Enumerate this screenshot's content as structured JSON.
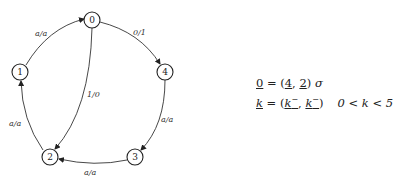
{
  "diagram": {
    "type": "state-machine",
    "nodes": [
      {
        "id": "0",
        "label": "0",
        "x": 92,
        "y": 20
      },
      {
        "id": "1",
        "label": "1",
        "x": 20,
        "y": 72
      },
      {
        "id": "2",
        "label": "2",
        "x": 50,
        "y": 157
      },
      {
        "id": "3",
        "label": "3",
        "x": 135,
        "y": 157
      },
      {
        "id": "4",
        "label": "4",
        "x": 165,
        "y": 72
      }
    ],
    "edges": [
      {
        "from": "1",
        "to": "0",
        "label": "a/a"
      },
      {
        "from": "0",
        "to": "4",
        "label": "0/1"
      },
      {
        "from": "0",
        "to": "2",
        "label": "1/0"
      },
      {
        "from": "4",
        "to": "3",
        "label": "a/a"
      },
      {
        "from": "3",
        "to": "2",
        "label": "a/a"
      },
      {
        "from": "2",
        "to": "1",
        "label": "a/a"
      }
    ]
  },
  "formulas": {
    "line1": {
      "lhs": "0",
      "eq": " = (",
      "a": "4",
      "comma": ", ",
      "b": "2",
      "close": ")",
      "sigma": " σ"
    },
    "line2": {
      "lhs": "k",
      "eq": " = (",
      "a": "k",
      "a_sup": "−",
      "comma": ", ",
      "b": "k",
      "b_sup": "−",
      "close": ")",
      "cond": "0 < k < 5"
    }
  }
}
